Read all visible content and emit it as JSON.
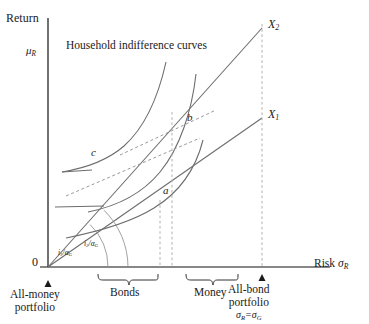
{
  "figure": {
    "axes": {
      "y_axis_label": "Return",
      "y_axis_symbol": "μ",
      "y_axis_symbol_sub": "R",
      "x_axis_label": "Risk",
      "x_axis_symbol": "σ",
      "x_axis_symbol_sub": "R",
      "origin_label": "0"
    },
    "title_note": "Household indifference curves",
    "opportunity_lines": [
      {
        "name": "X1",
        "label": "X",
        "label_sub": "1"
      },
      {
        "name": "X2",
        "label": "X",
        "label_sub": "2"
      }
    ],
    "slope_labels": [
      {
        "name": "i1-over-alphaG",
        "numerator": "i",
        "numerator_sub": "1",
        "denominator": "α",
        "denominator_sub": "G"
      },
      {
        "name": "i2-over-alphaG",
        "numerator": "i",
        "numerator_sub": "2",
        "denominator": "α",
        "denominator_sub": "G"
      }
    ],
    "equilibrium_points": [
      {
        "name": "point-a",
        "label": "a"
      },
      {
        "name": "point-b",
        "label": "b"
      },
      {
        "name": "point-c",
        "label": "c"
      }
    ],
    "brackets": [
      {
        "name": "bonds",
        "label": "Bonds"
      },
      {
        "name": "money",
        "label": "Money"
      }
    ],
    "endpoint_annotations": [
      {
        "name": "all-money-portfolio",
        "line1": "All-money",
        "line2": "portfolio",
        "line3": ""
      },
      {
        "name": "all-bond-portfolio",
        "line1": "All-bond",
        "line2": "portfolio",
        "line3_lhs": "σ",
        "line3_lhs_sub": "R",
        "line3_eq": "=",
        "line3_rhs": "σ",
        "line3_rhs_sub": "G"
      }
    ],
    "colors": {
      "axis": "#111111",
      "curve": "#6d6d6d",
      "ray": "#6d6d6d",
      "dashed": "#9a9a9a",
      "text": "#1a1a1a"
    }
  }
}
